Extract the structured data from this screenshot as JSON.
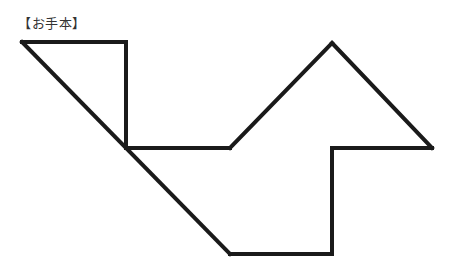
{
  "caption": "【お手本】",
  "figure": {
    "stroke_color": "#1a1a1a",
    "stroke_width": 4,
    "segments": [
      [
        22,
        42,
        126,
        42
      ],
      [
        126,
        42,
        126,
        148
      ],
      [
        22,
        42,
        230,
        254
      ],
      [
        126,
        148,
        230,
        148
      ],
      [
        230,
        148,
        332,
        43
      ],
      [
        332,
        43,
        432,
        148
      ],
      [
        332,
        148,
        432,
        148
      ],
      [
        332,
        148,
        332,
        254
      ],
      [
        230,
        254,
        332,
        254
      ]
    ]
  }
}
